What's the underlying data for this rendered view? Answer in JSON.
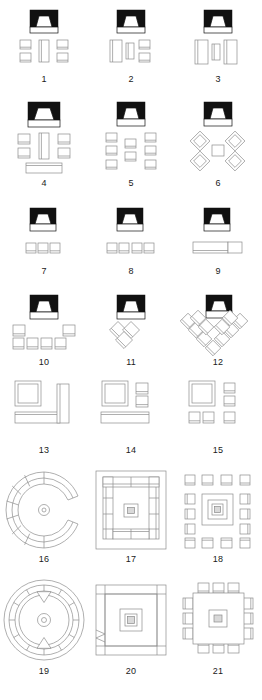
{
  "sheet": {
    "title": "Room Seating / Furniture Layout Plan Icons",
    "background_color": "#ffffff",
    "line_color": "#8c8c8c",
    "accent_color": "#111111",
    "columns": 3,
    "rows": 7,
    "total_figures": 21
  },
  "figures": [
    {
      "number": "1",
      "name": "boardroom-small",
      "icon": "screen-icon",
      "col": 0,
      "row": 0
    },
    {
      "number": "2",
      "name": "u-shape-small",
      "icon": "screen-icon",
      "col": 1,
      "row": 0
    },
    {
      "number": "3",
      "name": "three-panel",
      "icon": "screen-icon",
      "col": 2,
      "row": 0
    },
    {
      "number": "4",
      "name": "boardroom-with-head",
      "icon": "screen-icon",
      "col": 0,
      "row": 1
    },
    {
      "number": "5",
      "name": "classroom-grid",
      "icon": "screen-icon",
      "col": 1,
      "row": 1
    },
    {
      "number": "6",
      "name": "cabaret-rounds",
      "icon": "screen-icon",
      "col": 2,
      "row": 1
    },
    {
      "number": "7",
      "name": "theatre-three-seats",
      "icon": "screen-icon",
      "col": 0,
      "row": 2
    },
    {
      "number": "8",
      "name": "theatre-four-seats",
      "icon": "screen-icon",
      "col": 1,
      "row": 2
    },
    {
      "number": "9",
      "name": "long-bench",
      "icon": "screen-icon",
      "col": 2,
      "row": 2
    },
    {
      "number": "10",
      "name": "theatre-two-rows",
      "icon": "screen-icon",
      "col": 0,
      "row": 3
    },
    {
      "number": "11",
      "name": "chevron-small",
      "icon": "screen-icon",
      "col": 1,
      "row": 3
    },
    {
      "number": "12",
      "name": "chevron-large",
      "icon": "screen-icon",
      "col": 2,
      "row": 3
    },
    {
      "number": "13",
      "name": "l-shape-lounge",
      "icon": "tv-corner-icon",
      "col": 0,
      "row": 4
    },
    {
      "number": "14",
      "name": "lounge-with-bench",
      "icon": "tv-corner-icon",
      "col": 1,
      "row": 4
    },
    {
      "number": "15",
      "name": "lounge-with-chairs",
      "icon": "tv-corner-icon",
      "col": 2,
      "row": 4
    },
    {
      "number": "16",
      "name": "horseshoe-round",
      "icon": "none",
      "col": 0,
      "row": 5
    },
    {
      "number": "17",
      "name": "u-shape-conference",
      "icon": "none",
      "col": 1,
      "row": 5
    },
    {
      "number": "18",
      "name": "hollow-square-banquet",
      "icon": "none",
      "col": 2,
      "row": 5
    },
    {
      "number": "19",
      "name": "full-circle-round",
      "icon": "none",
      "col": 0,
      "row": 6
    },
    {
      "number": "20",
      "name": "closed-square-table",
      "icon": "none",
      "col": 1,
      "row": 6
    },
    {
      "number": "21",
      "name": "square-table-seating",
      "icon": "none",
      "col": 2,
      "row": 6
    }
  ]
}
